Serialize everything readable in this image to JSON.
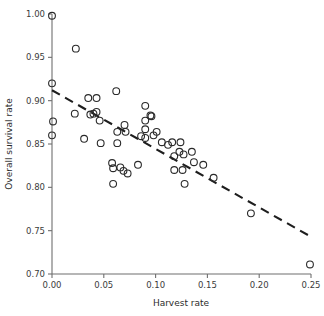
{
  "chart_data": {
    "type": "scatter",
    "title": "",
    "xlabel": "Harvest rate",
    "ylabel": "Overall survival rate",
    "xlim": [
      0.0,
      0.25
    ],
    "ylim": [
      0.7,
      1.0
    ],
    "xticks": [
      "0.00",
      "0.05",
      "0.10",
      "0.15",
      "0.20",
      "0.25"
    ],
    "xtick_values": [
      0.0,
      0.05,
      0.1,
      0.15,
      0.2,
      0.25
    ],
    "yticks": [
      "0.70",
      "0.75",
      "0.80",
      "0.85",
      "0.90",
      "0.95",
      "1.00"
    ],
    "ytick_values": [
      0.7,
      0.75,
      0.8,
      0.85,
      0.9,
      0.95,
      1.0
    ],
    "grid": false,
    "legend": null,
    "marker": "open-circle",
    "marker_color": "#2a2a2a",
    "points": [
      {
        "x": 0.0,
        "y": 0.998
      },
      {
        "x": 0.0,
        "y": 0.92
      },
      {
        "x": 0.001,
        "y": 0.876
      },
      {
        "x": 0.0,
        "y": 0.86
      },
      {
        "x": 0.023,
        "y": 0.96
      },
      {
        "x": 0.022,
        "y": 0.885
      },
      {
        "x": 0.031,
        "y": 0.856
      },
      {
        "x": 0.035,
        "y": 0.903
      },
      {
        "x": 0.037,
        "y": 0.884
      },
      {
        "x": 0.04,
        "y": 0.885
      },
      {
        "x": 0.043,
        "y": 0.903
      },
      {
        "x": 0.043,
        "y": 0.887
      },
      {
        "x": 0.046,
        "y": 0.877
      },
      {
        "x": 0.047,
        "y": 0.851
      },
      {
        "x": 0.058,
        "y": 0.828
      },
      {
        "x": 0.059,
        "y": 0.822
      },
      {
        "x": 0.059,
        "y": 0.804
      },
      {
        "x": 0.062,
        "y": 0.911
      },
      {
        "x": 0.063,
        "y": 0.864
      },
      {
        "x": 0.063,
        "y": 0.851
      },
      {
        "x": 0.066,
        "y": 0.823
      },
      {
        "x": 0.069,
        "y": 0.819
      },
      {
        "x": 0.07,
        "y": 0.872
      },
      {
        "x": 0.071,
        "y": 0.864
      },
      {
        "x": 0.073,
        "y": 0.816
      },
      {
        "x": 0.083,
        "y": 0.826
      },
      {
        "x": 0.086,
        "y": 0.859
      },
      {
        "x": 0.09,
        "y": 0.894
      },
      {
        "x": 0.09,
        "y": 0.877
      },
      {
        "x": 0.09,
        "y": 0.867
      },
      {
        "x": 0.09,
        "y": 0.857
      },
      {
        "x": 0.095,
        "y": 0.883
      },
      {
        "x": 0.096,
        "y": 0.882
      },
      {
        "x": 0.098,
        "y": 0.86
      },
      {
        "x": 0.101,
        "y": 0.864
      },
      {
        "x": 0.106,
        "y": 0.852
      },
      {
        "x": 0.112,
        "y": 0.849
      },
      {
        "x": 0.116,
        "y": 0.852
      },
      {
        "x": 0.118,
        "y": 0.836
      },
      {
        "x": 0.118,
        "y": 0.82
      },
      {
        "x": 0.123,
        "y": 0.841
      },
      {
        "x": 0.124,
        "y": 0.852
      },
      {
        "x": 0.126,
        "y": 0.82
      },
      {
        "x": 0.127,
        "y": 0.838
      },
      {
        "x": 0.128,
        "y": 0.804
      },
      {
        "x": 0.135,
        "y": 0.841
      },
      {
        "x": 0.137,
        "y": 0.829
      },
      {
        "x": 0.146,
        "y": 0.826
      },
      {
        "x": 0.156,
        "y": 0.811
      },
      {
        "x": 0.192,
        "y": 0.77
      },
      {
        "x": 0.249,
        "y": 0.711
      }
    ],
    "trendline": {
      "style": "dashed",
      "x_start": 0.0,
      "y_start": 0.912,
      "x_end": 0.25,
      "y_end": 0.743,
      "color": "#1e1e1e"
    }
  }
}
